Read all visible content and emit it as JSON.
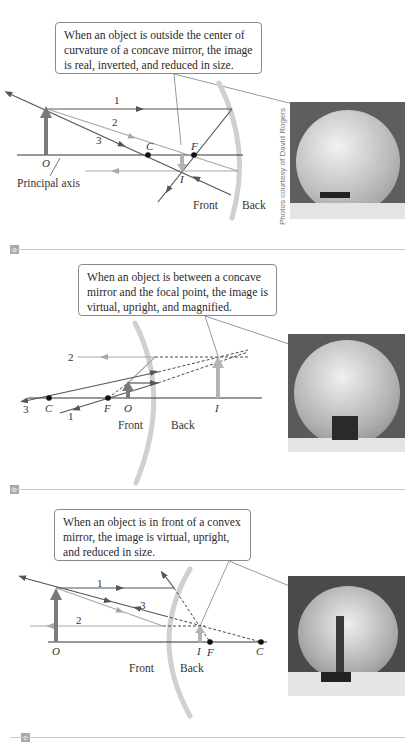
{
  "figure": {
    "credit": "Photos courtesy of David Rogers",
    "colors": {
      "ray_dark": "#555555",
      "ray_light": "#a8a8a8",
      "mirror": "#d0d0d0",
      "object_arrow": "#7a7a7a",
      "image_arrow": "#b4b4b4",
      "axis": "#333333",
      "callout_border": "#8a8a8a",
      "badge": "#a9a9a9"
    }
  },
  "panels": [
    {
      "label": "a",
      "callout": "When an object is outside the center of curvature of a concave mirror, the image is real, inverted, and reduced in size.",
      "ray_labels": [
        "1",
        "2",
        "3"
      ],
      "points": {
        "object": "O",
        "center": "C",
        "focal": "F",
        "image": "I"
      },
      "axis_label": "Principal axis",
      "side_front": "Front",
      "side_back": "Back",
      "mirror_type": "concave"
    },
    {
      "label": "b",
      "callout": "When an object is between a concave mirror and the focal point, the image is virtual, upright, and magnified.",
      "ray_labels": [
        "1",
        "2",
        "3"
      ],
      "points": {
        "object": "O",
        "center": "C",
        "focal": "F",
        "image": "I"
      },
      "side_front": "Front",
      "side_back": "Back",
      "mirror_type": "concave"
    },
    {
      "label": "c",
      "callout": "When an object is in front of a convex mirror, the image is virtual, upright, and reduced in size.",
      "ray_labels": [
        "1",
        "2",
        "3"
      ],
      "points": {
        "object": "O",
        "center": "C",
        "focal": "F",
        "image": "I"
      },
      "side_front": "Front",
      "side_back": "Back",
      "mirror_type": "convex"
    }
  ]
}
